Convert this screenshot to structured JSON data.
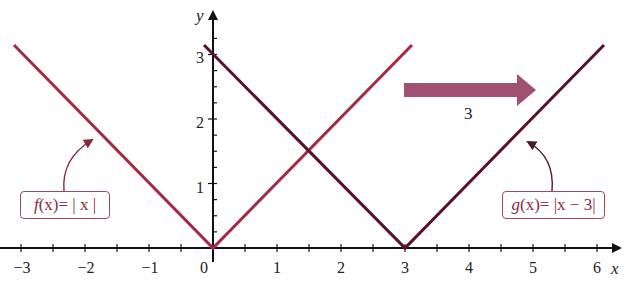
{
  "chart_data": {
    "type": "line",
    "title": "",
    "xlabel": "x",
    "ylabel": "y",
    "xlim": [
      -3.2,
      6.4
    ],
    "ylim": [
      0,
      3.3
    ],
    "x_ticks": [
      -3,
      -2,
      -1,
      0,
      1,
      2,
      3,
      4,
      5,
      6
    ],
    "y_ticks": [
      1,
      2,
      3
    ],
    "grid": false,
    "legend_position": "none",
    "series": [
      {
        "name": "f(x) = |x|",
        "color": "#a52a45",
        "points": [
          [
            -3.15,
            3.15
          ],
          [
            0,
            0
          ],
          [
            3.15,
            3.15
          ]
        ]
      },
      {
        "name": "g(x) = |x − 3|",
        "color": "#5a1228",
        "points": [
          [
            -0.15,
            3.15
          ],
          [
            3,
            0
          ],
          [
            6.15,
            3.15
          ]
        ]
      }
    ],
    "annotations": [
      {
        "type": "callout",
        "text": "f(x) = |x|",
        "points_to": [
          -1.9,
          1.6
        ]
      },
      {
        "type": "callout",
        "text": "g(x) = |x − 3|",
        "points_to": [
          4.9,
          1.7
        ]
      },
      {
        "type": "arrow",
        "direction": "right",
        "text": "3",
        "meaning": "horizontal shift by 3 units"
      }
    ]
  },
  "labels": {
    "x_axis": "x",
    "y_axis": "y",
    "x_ticks": [
      "−3",
      "−2",
      "−1",
      "0",
      "1",
      "2",
      "3",
      "4",
      "5",
      "6"
    ],
    "y_ticks": [
      "1",
      "2",
      "3"
    ],
    "f_func": "f",
    "f_arg": "(x)",
    "f_rhs": " = | x |",
    "g_func": "g",
    "g_arg": "(x)",
    "g_rhs": " = |x − 3|",
    "shift_value": "3"
  },
  "colors": {
    "f_line": "#a52a45",
    "g_line": "#5a1228",
    "shift_arrow": "#a05070",
    "axis": "#111111"
  }
}
